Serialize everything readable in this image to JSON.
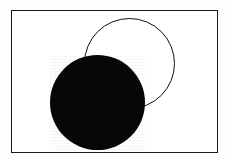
{
  "figure": {
    "canvas_width": 226,
    "canvas_height": 160,
    "background_color": "#fdfdfd"
  },
  "frame": {
    "label": "rectangular border frame",
    "x": 11,
    "y": 10,
    "width": 207,
    "height": 143,
    "border_width": 1,
    "border_color": "#1a1a1a",
    "fill_color": "#ffffff"
  },
  "shapes": [
    {
      "name": "outline-circle",
      "label": "Outlined circle",
      "style": "stroke",
      "center_x": 129.5,
      "center_y": 63,
      "radius": 45.5,
      "stroke_color": "#111111",
      "stroke_width": 1,
      "fill_color": "transparent",
      "z_index": 1
    },
    {
      "name": "filled-circle",
      "label": "Solid black circle",
      "style": "fill",
      "center_x": 97.5,
      "center_y": 102.5,
      "radius": 47.5,
      "stroke_color": "none",
      "stroke_width": 0,
      "fill_color": "#070707",
      "z_index": 2
    }
  ]
}
